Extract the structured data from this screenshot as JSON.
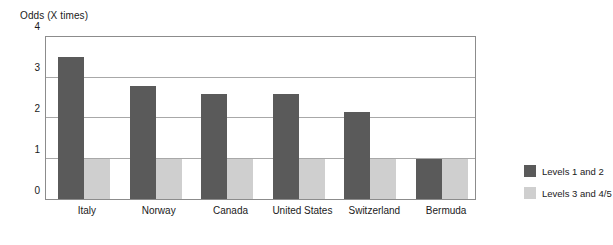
{
  "chart_data": {
    "type": "bar",
    "title": "Odds (X times)",
    "xlabel": "",
    "ylabel": "Odds (X times)",
    "categories": [
      "Italy",
      "Norway",
      "Canada",
      "United States",
      "Switzerland",
      "Bermuda"
    ],
    "series": [
      {
        "name": "Levels 1 and 2",
        "values": [
          3.5,
          2.8,
          2.6,
          2.6,
          2.15,
          1.0
        ],
        "color": "#5a5a5a"
      },
      {
        "name": "Levels 3 and 4/5",
        "values": [
          1.0,
          1.0,
          1.0,
          1.0,
          1.0,
          1.0
        ],
        "color": "#cfcfcf"
      }
    ],
    "ylim": [
      0,
      4
    ],
    "yticks": [
      0,
      1,
      2,
      3,
      4
    ],
    "ytick_labels": [
      "0",
      "1",
      "2",
      "3",
      "4"
    ],
    "grid": true,
    "grid_axis": "y",
    "legend_position": "right",
    "legend": [
      "Levels 1 and 2",
      "Levels 3 and 4/5"
    ]
  },
  "colors": {
    "series_a": "#5a5a5a",
    "series_b": "#cfcfcf",
    "grid": "#a8a8a8",
    "frame": "#8c8c8c",
    "text": "#1a1a1a",
    "background": "#ffffff"
  }
}
